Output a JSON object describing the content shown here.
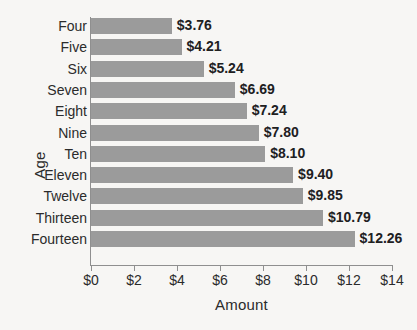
{
  "chart_data": {
    "type": "bar",
    "orientation": "horizontal",
    "title": "",
    "xlabel": "Amount",
    "ylabel": "Age",
    "categories": [
      "Four",
      "Five",
      "Six",
      "Seven",
      "Eight",
      "Nine",
      "Ten",
      "Eleven",
      "Twelve",
      "Thirteen",
      "Fourteen"
    ],
    "values": [
      3.76,
      4.21,
      5.24,
      6.69,
      7.24,
      7.8,
      8.1,
      9.4,
      9.85,
      10.79,
      12.26
    ],
    "data_labels": [
      "$3.76",
      "$4.21",
      "$5.24",
      "$6.69",
      "$7.24",
      "$7.80",
      "$8.10",
      "$9.40",
      "$9.85",
      "$10.79",
      "$12.26"
    ],
    "xlim": [
      0,
      14
    ],
    "xticks": [
      0,
      2,
      4,
      6,
      8,
      10,
      12,
      14
    ],
    "xtick_labels": [
      "$0",
      "$2",
      "$4",
      "$6",
      "$8",
      "$10",
      "$12",
      "$14"
    ],
    "grid": false,
    "legend": null,
    "bar_color": "#9b9b9b",
    "background_color": "#f7f6f4",
    "axis_color": "#8f8f8f",
    "text_color": "#2b2b2b"
  }
}
